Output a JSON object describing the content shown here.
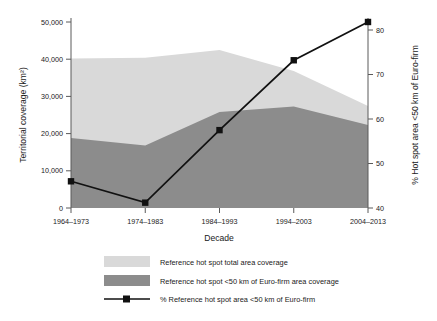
{
  "chart_data": {
    "type": "area",
    "title": "",
    "xlabel": "Decade",
    "ylabel": "Territorial coverage (km²)",
    "y2label": "% Hot spot area <50 km of Euro-firm",
    "categories": [
      "1964–1973",
      "1974–1983",
      "1984–1993",
      "1994–2003",
      "2004–2013"
    ],
    "ylim": [
      0,
      50000
    ],
    "y2lim": [
      40,
      82
    ],
    "yticks": [
      0,
      10000,
      20000,
      30000,
      40000,
      50000
    ],
    "ytick_labels": [
      "0",
      "10,000",
      "20,000",
      "30,000",
      "40,000",
      "50,000"
    ],
    "y2ticks": [
      40,
      50,
      60,
      70,
      80
    ],
    "y2tick_labels": [
      "40",
      "50",
      "60",
      "70",
      "80"
    ],
    "grid": false,
    "legend_position": "below",
    "series": [
      {
        "name": "Reference hot spot total area coverage",
        "type": "area",
        "axis": "left",
        "color": "#d9d9d9",
        "values": [
          40200,
          40400,
          42500,
          36800,
          27400
        ]
      },
      {
        "name": "Reference hot spot <50 km of Euro-firm area coverage",
        "type": "area",
        "axis": "left",
        "color": "#8c8c8c",
        "values": [
          18800,
          16800,
          25800,
          27300,
          22300
        ]
      },
      {
        "name": "% Reference hot spot area <50 km of Euro-firm",
        "type": "line",
        "axis": "right",
        "color": "#111111",
        "values": [
          46.0,
          41.2,
          57.5,
          73.2,
          81.8
        ]
      }
    ]
  },
  "legend": {
    "items": [
      {
        "label": "Reference hot spot total area coverage",
        "swatch": "area-light"
      },
      {
        "label": "Reference hot spot <50 km of Euro-firm area coverage",
        "swatch": "area-dark"
      },
      {
        "label": "% Reference hot spot area <50 km of Euro-firm",
        "swatch": "line-marker"
      }
    ]
  }
}
